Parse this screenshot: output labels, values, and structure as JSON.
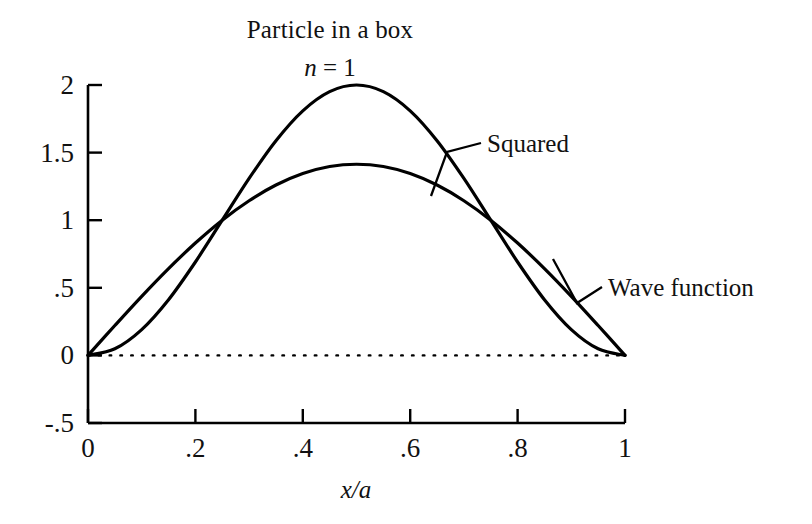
{
  "chart_data": {
    "type": "line",
    "title": "Particle in a box",
    "subtitle_n": "n",
    "subtitle_eq": " = 1",
    "subtitle_full": "n = 1",
    "xlabel": "x/a",
    "ylabel": "",
    "xlim": [
      0,
      1
    ],
    "ylim": [
      -0.5,
      2
    ],
    "xticks": [
      "0",
      ".2",
      ".4",
      ".6",
      ".8",
      "1"
    ],
    "xtick_values": [
      0,
      0.2,
      0.4,
      0.6,
      0.8,
      1
    ],
    "yticks": [
      "2",
      "1.5",
      "1",
      ".5",
      "0",
      "-.5"
    ],
    "ytick_values": [
      2,
      1.5,
      1,
      0.5,
      0,
      -0.5
    ],
    "grid": false,
    "zero_line": true,
    "zero_line_style": "dotted",
    "legend_position": "inline-annotations",
    "line_color": "#000000",
    "series": [
      {
        "name": "Wave function",
        "formula": "sqrt(2)*sin(pi*x)",
        "peak": 1.414,
        "peak_x": 0.5,
        "x": [
          0,
          0.05,
          0.1,
          0.15,
          0.2,
          0.25,
          0.3,
          0.35,
          0.4,
          0.45,
          0.5,
          0.55,
          0.6,
          0.65,
          0.7,
          0.75,
          0.8,
          0.85,
          0.9,
          0.95,
          1
        ],
        "values": [
          0,
          0.221,
          0.437,
          0.642,
          0.831,
          1.0,
          1.144,
          1.26,
          1.345,
          1.397,
          1.414,
          1.397,
          1.345,
          1.26,
          1.144,
          1.0,
          0.831,
          0.642,
          0.437,
          0.221,
          0
        ]
      },
      {
        "name": "Squared",
        "formula": "2*sin(pi*x)^2",
        "peak": 2.0,
        "peak_x": 0.5,
        "x": [
          0,
          0.05,
          0.1,
          0.15,
          0.2,
          0.25,
          0.3,
          0.35,
          0.4,
          0.45,
          0.5,
          0.55,
          0.6,
          0.65,
          0.7,
          0.75,
          0.8,
          0.85,
          0.9,
          0.95,
          1
        ],
        "values": [
          0,
          0.049,
          0.191,
          0.412,
          0.691,
          1.0,
          1.309,
          1.588,
          1.809,
          1.951,
          2.0,
          1.951,
          1.809,
          1.588,
          1.309,
          1.0,
          0.691,
          0.412,
          0.191,
          0.049,
          0
        ]
      }
    ],
    "annotations": [
      {
        "text": "Squared",
        "x": 0.52,
        "y": 1.27
      },
      {
        "text": "Wave function",
        "x": 0.97,
        "y": 0.53
      }
    ],
    "crossings": [
      {
        "x": 0.25,
        "y": 1.0
      },
      {
        "x": 0.75,
        "y": 1.0
      }
    ]
  }
}
